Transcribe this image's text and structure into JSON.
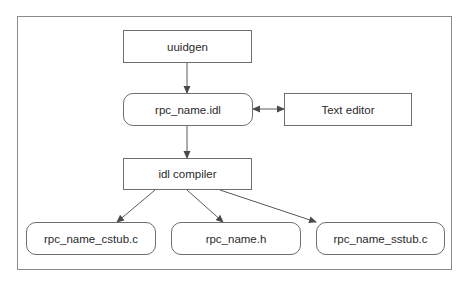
{
  "diagram": {
    "nodes": [
      {
        "id": "uuidgen",
        "label": "uuidgen",
        "shape": "rectangle"
      },
      {
        "id": "rpc_name_idl",
        "label": "rpc_name.idl",
        "shape": "rounded"
      },
      {
        "id": "text_editor",
        "label": "Text editor",
        "shape": "rectangle"
      },
      {
        "id": "idl_compiler",
        "label": "idl compiler",
        "shape": "rectangle"
      },
      {
        "id": "rpc_name_cstub",
        "label": "rpc_name_cstub.c",
        "shape": "rounded"
      },
      {
        "id": "rpc_name_h",
        "label": "rpc_name.h",
        "shape": "rounded"
      },
      {
        "id": "rpc_name_sstub",
        "label": "rpc_name_sstub.c",
        "shape": "rounded"
      }
    ],
    "edges": [
      {
        "from": "uuidgen",
        "to": "rpc_name_idl",
        "type": "arrow"
      },
      {
        "from": "rpc_name_idl",
        "to": "text_editor",
        "type": "bidirectional"
      },
      {
        "from": "rpc_name_idl",
        "to": "idl_compiler",
        "type": "arrow"
      },
      {
        "from": "idl_compiler",
        "to": "rpc_name_cstub",
        "type": "arrow"
      },
      {
        "from": "idl_compiler",
        "to": "rpc_name_h",
        "type": "arrow"
      },
      {
        "from": "idl_compiler",
        "to": "rpc_name_sstub",
        "type": "arrow"
      }
    ],
    "colors": {
      "stroke": "#6e6e6e",
      "text": "#2a2a2a",
      "frame": "#8a8a8a"
    }
  }
}
